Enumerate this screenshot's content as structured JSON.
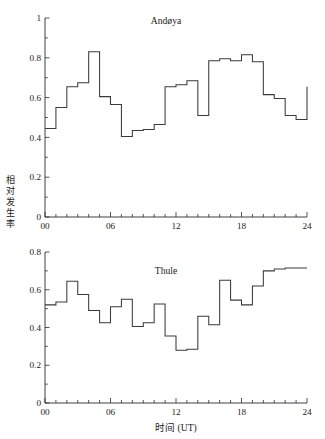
{
  "figure": {
    "axis_label_x": "时间 (UT)",
    "axis_label_y": "相对发生率",
    "x_tick_labels": [
      "00",
      "06",
      "12",
      "18",
      "24"
    ],
    "colors": {
      "line": "#3a3a3a",
      "axis": "#2b2b2b",
      "background": "#ffffff"
    }
  },
  "chart_data": [
    {
      "type": "line",
      "title": "Andøya",
      "xlabel": "",
      "ylabel": "相对发生率",
      "xlim": [
        0,
        24
      ],
      "ylim": [
        0,
        1
      ],
      "xticks": [
        0,
        6,
        12,
        18,
        24
      ],
      "xtick_labels": [
        "00",
        "06",
        "12",
        "18",
        "24"
      ],
      "yticks": [
        0,
        0.2,
        0.4,
        0.6,
        0.8,
        1
      ],
      "ytick_labels": [
        "0",
        "0.2",
        "0.4",
        "0.6",
        "0.8",
        "1"
      ],
      "minor_xtick_interval": 1,
      "grid": false,
      "legend": false,
      "drawstyle": "steps-post",
      "x": [
        0,
        1,
        2,
        3,
        4,
        5,
        6,
        7,
        8,
        9,
        10,
        11,
        12,
        13,
        14,
        15,
        16,
        17,
        18,
        19,
        20,
        21,
        22,
        23
      ],
      "values": [
        0.445,
        0.55,
        0.655,
        0.675,
        0.83,
        0.605,
        0.565,
        0.405,
        0.435,
        0.44,
        0.465,
        0.655,
        0.665,
        0.685,
        0.51,
        0.785,
        0.795,
        0.785,
        0.815,
        0.78,
        0.615,
        0.595,
        0.51,
        0.49
      ],
      "end_value": 0.655,
      "annotations": []
    },
    {
      "type": "line",
      "title": "Thule",
      "xlabel": "时间 (UT)",
      "ylabel": "相对发生率",
      "xlim": [
        0,
        24
      ],
      "ylim": [
        0,
        0.8
      ],
      "xticks": [
        0,
        6,
        12,
        18,
        24
      ],
      "xtick_labels": [
        "00",
        "06",
        "12",
        "18",
        "24"
      ],
      "yticks": [
        0,
        0.2,
        0.4,
        0.6,
        0.8
      ],
      "ytick_labels": [
        "0",
        "0.2",
        "0.4",
        "0.6",
        "0.8"
      ],
      "minor_xtick_interval": 1,
      "grid": false,
      "legend": false,
      "drawstyle": "steps-post",
      "x": [
        0,
        1,
        2,
        3,
        4,
        5,
        6,
        7,
        8,
        9,
        10,
        11,
        12,
        13,
        14,
        15,
        16,
        17,
        18,
        19,
        20,
        21,
        22,
        23
      ],
      "values": [
        0.52,
        0.535,
        0.645,
        0.575,
        0.49,
        0.425,
        0.51,
        0.55,
        0.405,
        0.425,
        0.525,
        0.355,
        0.28,
        0.285,
        0.46,
        0.415,
        0.65,
        0.545,
        0.52,
        0.62,
        0.7,
        0.71,
        0.715,
        0.715
      ],
      "end_value": 0.715,
      "annotations": []
    }
  ]
}
